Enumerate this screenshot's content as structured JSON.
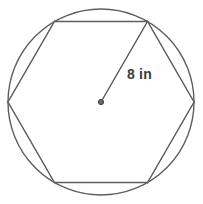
{
  "figure": {
    "kind": "geometry-diagram",
    "background_color": "#ffffff",
    "canvas": {
      "width": 203,
      "height": 204
    }
  },
  "circle": {
    "name": "circumscribed-circle",
    "center": {
      "x": 101,
      "y": 102
    },
    "radius": 93,
    "stroke_color": "#5e5e5e",
    "stroke_width": 1.4,
    "fill_color": "#ffffff"
  },
  "hexagon": {
    "name": "inscribed-regular-hexagon",
    "sides": 6,
    "orientation": "flat-top",
    "stroke_color": "#5e5e5e",
    "stroke_width": 1.4,
    "fill_color": "#ffffff",
    "vertex_angles_deg": [
      0,
      60,
      120,
      180,
      240,
      300
    ],
    "vertices": [
      {
        "label": "right",
        "x": 194,
        "y": 102
      },
      {
        "label": "top-right",
        "x": 147.5,
        "y": 21.5
      },
      {
        "label": "top-left",
        "x": 54.5,
        "y": 21.5
      },
      {
        "label": "left",
        "x": 8,
        "y": 102
      },
      {
        "label": "bottom-left",
        "x": 54.5,
        "y": 182.5
      },
      {
        "label": "bottom-right",
        "x": 147.5,
        "y": 182.5
      }
    ]
  },
  "segments": {
    "name": "shaded-circular-segments",
    "count": 6,
    "fill_color": "#e6e6e6",
    "stroke_color": "#6a6a6a",
    "stroke_width": 1.2
  },
  "radius_line": {
    "name": "radius-segment",
    "from": {
      "x": 101,
      "y": 102
    },
    "to": {
      "x": 147.5,
      "y": 21.5
    },
    "stroke_color": "#555555",
    "stroke_width": 1.4
  },
  "center_dot": {
    "name": "center-point-marker",
    "x": 101,
    "y": 102,
    "radius": 2.6,
    "fill_color": "#6b6b6b",
    "stroke_color": "#3f3f3f"
  },
  "labels": {
    "radius_measure": "8 in",
    "radius_value": 8,
    "radius_unit": "in",
    "text_color": "#3b3b3b"
  }
}
